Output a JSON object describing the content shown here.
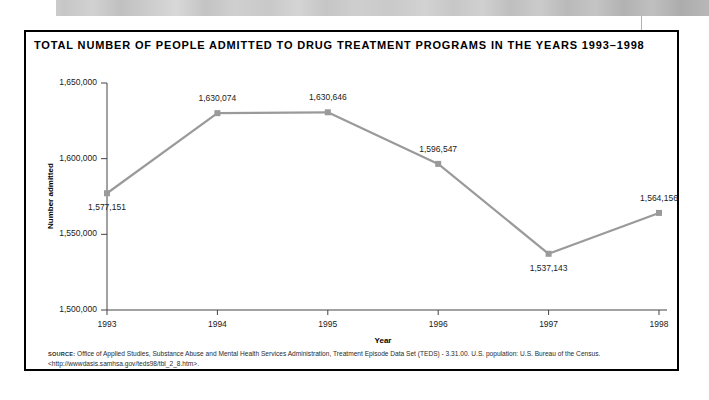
{
  "banner": {
    "name": "decorative-photo-strip"
  },
  "chart_title": "TOTAL NUMBER OF PEOPLE ADMITTED TO DRUG TREATMENT PROGRAMS IN THE YEARS 1993–1998",
  "source": {
    "label": "source:",
    "text": " Office of Applied Studies, Substance Abuse and Mental Health Services Administration, Treatment Episode Data Set (TEDS) - 3.31.00. U.S. population: U.S. Bureau of the Census. <http://wwwdasis.samhsa.gov/teds98/tbl_2_8.htm>."
  },
  "colors": {
    "line": "#9a9a9a",
    "marker": "#9a9a9a",
    "axis": "#444444",
    "border": "#000000",
    "text": "#1a1a1a"
  },
  "chart_data": {
    "type": "line",
    "title": "TOTAL NUMBER OF PEOPLE ADMITTED TO DRUG TREATMENT PROGRAMS IN THE YEARS 1993–1998",
    "xlabel": "Year",
    "ylabel": "Number admitted",
    "categories": [
      "1993",
      "1994",
      "1995",
      "1996",
      "1997",
      "1998"
    ],
    "values": [
      1577151,
      1630074,
      1630646,
      1596547,
      1537143,
      1564156
    ],
    "point_labels": [
      "1,577,151",
      "1,630,074",
      "1,630,646",
      "1,596,547",
      "1,537,143",
      "1,564,156"
    ],
    "point_label_position": [
      "below",
      "above",
      "above",
      "above",
      "below",
      "above"
    ],
    "ylim": [
      1500000,
      1650000
    ],
    "yticks": [
      1500000,
      1550000,
      1600000,
      1650000
    ],
    "ytick_labels": [
      "1,500,000",
      "1,550,000",
      "1,600,000",
      "1,650,000"
    ],
    "xticks": [
      "1993",
      "1994",
      "1995",
      "1996",
      "1997",
      "1998"
    ],
    "grid": false,
    "legend": false,
    "marker": "square",
    "series": [
      {
        "name": "Number admitted",
        "values": [
          1577151,
          1630074,
          1630646,
          1596547,
          1537143,
          1564156
        ]
      }
    ]
  }
}
